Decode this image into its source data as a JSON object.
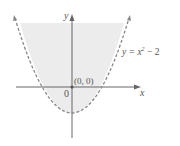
{
  "diagram": {
    "type": "parabola-region",
    "equation_label": {
      "prefix": "y = x",
      "exponent": "2",
      "suffix": " − 2"
    },
    "axis_labels": {
      "x": "x",
      "y": "y"
    },
    "origin_label": "0",
    "point_label": "(0, 0)",
    "colors": {
      "shade": "#ececec",
      "curve": "#888888",
      "axis": "#666666",
      "text": "#555555"
    }
  }
}
